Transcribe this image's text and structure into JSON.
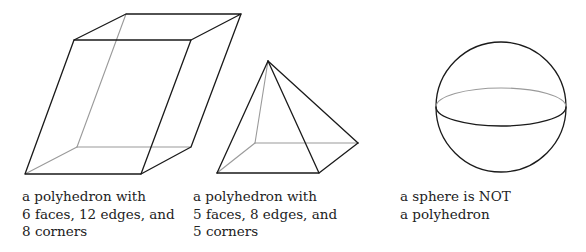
{
  "figures": [
    {
      "id": "parallelepiped",
      "caption": [
        "a polyhedron with",
        "6 faces, 12 edges, and",
        "8 corners"
      ]
    },
    {
      "id": "pyramid",
      "caption": [
        "a polyhedron with",
        "5 faces, 8 edges, and",
        "5 corners"
      ]
    },
    {
      "id": "sphere",
      "caption": [
        "a sphere is NOT",
        "a polyhedron"
      ]
    }
  ],
  "colors": {
    "visible_edge": "#1a1a1a",
    "hidden_edge": "#9a9a9a",
    "text": "#222222",
    "background": "#ffffff"
  }
}
